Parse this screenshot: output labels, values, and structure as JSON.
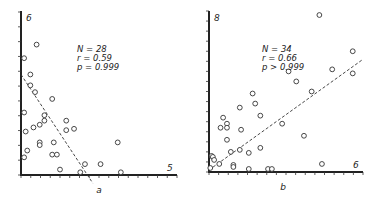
{
  "chart_data": [
    {
      "type": "scatter",
      "panel": "a",
      "xlabel": "a",
      "ylabel": "",
      "y_top_label": "6",
      "x_right_label": "5",
      "xlim": [
        0,
        5
      ],
      "ylim": [
        0,
        6
      ],
      "annotation": {
        "N": "N = 28",
        "r": "r = 0.59",
        "p": "p = 0.999"
      },
      "fit_line": {
        "style": "dashed",
        "x0": 0,
        "y0": 3.7,
        "x1": 2.3,
        "y1": -0.3
      },
      "points": [
        [
          0.5,
          4.8
        ],
        [
          0.1,
          4.3
        ],
        [
          0.3,
          3.7
        ],
        [
          0.3,
          3.3
        ],
        [
          0.45,
          3.05
        ],
        [
          0.1,
          2.3
        ],
        [
          1.0,
          2.8
        ],
        [
          0.75,
          2.2
        ],
        [
          0.75,
          2.0
        ],
        [
          1.45,
          2.0
        ],
        [
          0.4,
          1.75
        ],
        [
          0.6,
          1.85
        ],
        [
          1.45,
          1.65
        ],
        [
          1.7,
          1.7
        ],
        [
          0.6,
          1.2
        ],
        [
          0.6,
          1.1
        ],
        [
          1.05,
          1.2
        ],
        [
          0.2,
          0.9
        ],
        [
          0.1,
          0.65
        ],
        [
          1.0,
          0.75
        ],
        [
          1.15,
          0.75
        ],
        [
          1.25,
          0.2
        ],
        [
          1.9,
          0.1
        ],
        [
          2.05,
          0.4
        ],
        [
          2.55,
          0.4
        ],
        [
          3.1,
          1.2
        ],
        [
          3.2,
          0.1
        ],
        [
          0.15,
          1.6
        ]
      ]
    },
    {
      "type": "scatter",
      "panel": "b",
      "xlabel": "b",
      "ylabel": "",
      "y_top_label": "8",
      "x_right_label": "6",
      "xlim": [
        0,
        6
      ],
      "ylim": [
        0,
        8
      ],
      "annotation": {
        "N": "N = 34",
        "r": "r = 0.66",
        "p": "p > 0.999"
      },
      "fit_line": {
        "style": "dashed",
        "x0": 0,
        "y0": 0.1,
        "x1": 6.0,
        "y1": 5.6
      },
      "points": [
        [
          0.05,
          0.2
        ],
        [
          0.1,
          0.8
        ],
        [
          0.15,
          0.75
        ],
        [
          0.2,
          0.6
        ],
        [
          0.4,
          0.4
        ],
        [
          0.45,
          2.2
        ],
        [
          0.55,
          2.7
        ],
        [
          0.7,
          2.4
        ],
        [
          0.7,
          2.2
        ],
        [
          0.7,
          1.6
        ],
        [
          0.85,
          1.0
        ],
        [
          0.95,
          0.35
        ],
        [
          0.95,
          0.25
        ],
        [
          1.2,
          3.2
        ],
        [
          1.25,
          2.1
        ],
        [
          1.2,
          1.1
        ],
        [
          1.55,
          0.95
        ],
        [
          1.55,
          0.15
        ],
        [
          1.7,
          3.9
        ],
        [
          1.8,
          3.4
        ],
        [
          2.0,
          2.8
        ],
        [
          2.0,
          1.2
        ],
        [
          2.3,
          0.15
        ],
        [
          2.45,
          0.15
        ],
        [
          2.85,
          2.4
        ],
        [
          3.1,
          5.0
        ],
        [
          3.4,
          4.5
        ],
        [
          3.7,
          1.8
        ],
        [
          4.0,
          4.0
        ],
        [
          4.3,
          7.8
        ],
        [
          4.4,
          0.4
        ],
        [
          4.8,
          5.1
        ],
        [
          5.6,
          6.0
        ],
        [
          5.6,
          4.9
        ]
      ]
    }
  ]
}
